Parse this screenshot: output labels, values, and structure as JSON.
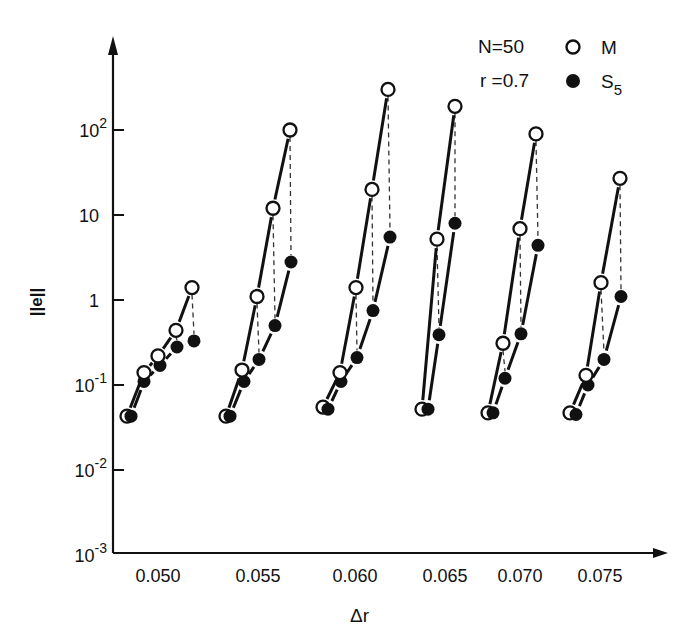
{
  "chart_data": {
    "type": "line",
    "title": "",
    "xlabel": "Δr",
    "ylabel": "||e||",
    "yscale": "log",
    "ylim": [
      0.001,
      1000
    ],
    "y_ticks": [
      {
        "label": "10",
        "sup": "2",
        "value": 100
      },
      {
        "label": "10",
        "sup": "",
        "value": 10
      },
      {
        "label": "1",
        "sup": "",
        "value": 1
      },
      {
        "label": "10",
        "sup": "-1",
        "value": 0.1
      },
      {
        "label": "10",
        "sup": "-2",
        "value": 0.01
      },
      {
        "label": "10",
        "sup": "-3",
        "value": 0.001
      }
    ],
    "categories": [
      "0.050",
      "0.055",
      "0.060",
      "0.065",
      "0.070",
      "0.075"
    ],
    "category_label_x": [
      158,
      258,
      355,
      445,
      520,
      600
    ],
    "annotations": [
      {
        "text": "N=50"
      },
      {
        "text": "r =0.7"
      }
    ],
    "legend": [
      {
        "label": "M",
        "marker": "open-circle"
      },
      {
        "label": "S",
        "sub": "5",
        "marker": "filled-circle"
      }
    ],
    "grid": false,
    "groups": [
      {
        "dr": "0.050",
        "M": {
          "x": [
            127,
            144,
            158,
            176,
            192
          ],
          "values": [
            0.043,
            0.14,
            0.22,
            0.44,
            1.4
          ]
        },
        "S5": {
          "x": [
            131,
            144,
            160,
            177,
            194
          ],
          "values": [
            0.043,
            0.11,
            0.17,
            0.28,
            0.33
          ]
        }
      },
      {
        "dr": "0.055",
        "M": {
          "x": [
            226,
            242,
            257,
            273,
            290
          ],
          "values": [
            0.043,
            0.15,
            1.1,
            12,
            100
          ]
        },
        "S5": {
          "x": [
            230,
            244,
            259,
            275,
            291
          ],
          "values": [
            0.043,
            0.11,
            0.2,
            0.5,
            2.8
          ]
        }
      },
      {
        "dr": "0.060",
        "M": {
          "x": [
            323,
            340,
            356,
            372,
            388
          ],
          "values": [
            0.055,
            0.14,
            1.4,
            20,
            300
          ]
        },
        "S5": {
          "x": [
            328,
            341,
            357,
            373,
            390
          ],
          "values": [
            0.052,
            0.11,
            0.21,
            0.75,
            5.5
          ]
        }
      },
      {
        "dr": "0.065",
        "M": {
          "x": [
            422,
            437,
            455
          ],
          "values": [
            0.052,
            5.2,
            190
          ]
        },
        "S5": {
          "x": [
            428,
            439,
            455
          ],
          "values": [
            0.052,
            0.39,
            8.0
          ]
        }
      },
      {
        "dr": "0.070",
        "M": {
          "x": [
            488,
            503,
            520,
            536
          ],
          "values": [
            0.047,
            0.31,
            6.9,
            90
          ]
        },
        "S5": {
          "x": [
            493,
            505,
            521,
            538
          ],
          "values": [
            0.047,
            0.12,
            0.4,
            4.4
          ]
        }
      },
      {
        "dr": "0.075",
        "M": {
          "x": [
            570,
            586,
            601,
            620
          ],
          "values": [
            0.047,
            0.13,
            1.6,
            27
          ]
        },
        "S5": {
          "x": [
            576,
            588,
            604,
            621
          ],
          "values": [
            0.045,
            0.1,
            0.2,
            1.1
          ]
        }
      }
    ]
  },
  "legend_text": {
    "n_label": "N=50",
    "r_label": "r =0.7",
    "m_label": "M",
    "s_label": "S",
    "s_sub": "5"
  },
  "axis_text": {
    "xlabel": "Δr",
    "ylabel": "||e||"
  }
}
